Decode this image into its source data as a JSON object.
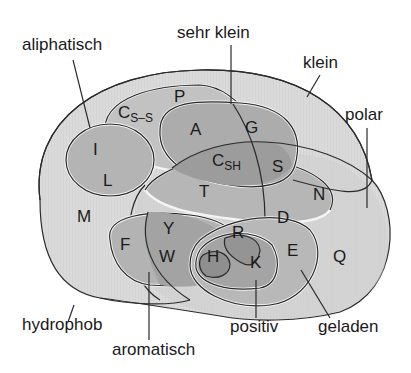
{
  "diagram": {
    "type": "venn",
    "colors": {
      "background": "#ffffff",
      "outer_fill": "#d9d9d9",
      "mid_fill": "#bdbdbd",
      "inner_fill": "#a8a8a8",
      "deep_fill": "#969696",
      "outline": "#2a2a2a",
      "text": "#1a1a1a"
    },
    "set_labels": {
      "aliphatisch": "aliphatisch",
      "sehr_klein": "sehr klein",
      "klein": "klein",
      "polar": "polar",
      "hydrophob": "hydrophob",
      "aromatisch": "aromatisch",
      "positiv": "positiv",
      "geladen": "geladen"
    },
    "amino_acids": {
      "P": "P",
      "Css_main": "C",
      "Css_sub": "S–S",
      "I": "I",
      "L": "L",
      "A": "A",
      "G": "G",
      "Csh_main": "C",
      "Csh_sub": "SH",
      "S": "S",
      "T": "T",
      "N": "N",
      "M": "M",
      "F": "F",
      "Y": "Y",
      "W": "W",
      "R": "R",
      "D": "D",
      "H": "H",
      "K": "K",
      "E": "E",
      "Q": "Q"
    },
    "sets": [
      {
        "name": "hydrophob",
        "members": [
          "I",
          "L",
          "M",
          "F",
          "Y",
          "W",
          "H",
          "K",
          "A",
          "G",
          "C",
          "T",
          "V"
        ]
      },
      {
        "name": "polar",
        "members": [
          "Y",
          "W",
          "H",
          "K",
          "R",
          "E",
          "D",
          "Q",
          "N",
          "S",
          "T",
          "C"
        ]
      },
      {
        "name": "klein",
        "members": [
          "P",
          "C",
          "A",
          "G",
          "S",
          "T",
          "N",
          "D",
          "V"
        ]
      },
      {
        "name": "sehr klein",
        "members": [
          "A",
          "G",
          "C",
          "S"
        ]
      },
      {
        "name": "aliphatisch",
        "members": [
          "I",
          "L",
          "V"
        ]
      },
      {
        "name": "aromatisch",
        "members": [
          "F",
          "Y",
          "W",
          "H"
        ]
      },
      {
        "name": "geladen",
        "members": [
          "D",
          "E",
          "H",
          "K",
          "R"
        ]
      },
      {
        "name": "positiv",
        "members": [
          "H",
          "K",
          "R"
        ]
      }
    ]
  }
}
